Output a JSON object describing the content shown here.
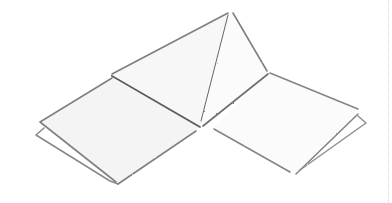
{
  "image": {
    "description": "Pencil sketch of a folded paper form: a triangular tent-like ridge in the center with two flat square flaps extending left and right, each flap with a slightly offset second sheet beneath it.",
    "style": "graphite line drawing on white",
    "colors": {
      "background": "#ffffff",
      "stroke": "#7a7a7a",
      "stroke_dark": "#5c5c5c",
      "shade": "#f1f1f1"
    }
  }
}
